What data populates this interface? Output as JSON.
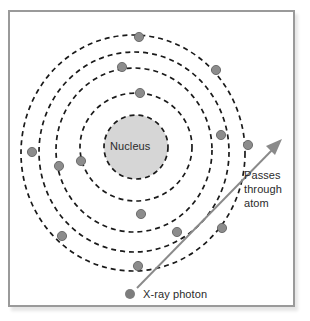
{
  "diagram": {
    "title_label": "Nucleus",
    "beam_label": "Passes\nthrough\natom",
    "photon_label": "X-ray photon",
    "colors": {
      "frame_border": "#9a9a9a",
      "background": "#ffffff",
      "nucleus_fill": "#d6d6d6",
      "orbit_stroke": "#1a1a1a",
      "electron_fill": "#8c8c8c",
      "electron_stroke": "#4a4a4a",
      "arrow_stroke": "#8a8a8a",
      "photon_fill": "#7d7d7d",
      "text": "#2b2b2b"
    },
    "nucleus": {
      "cx": 136,
      "cy": 147,
      "r": 32
    },
    "orbits": [
      {
        "name": "shell-1",
        "cx": 136,
        "cy": 147,
        "rx": 56,
        "ry": 54
      },
      {
        "name": "shell-2",
        "cx": 134,
        "cy": 150,
        "rx": 78,
        "ry": 82
      },
      {
        "name": "shell-3",
        "cx": 134,
        "cy": 152,
        "rx": 95,
        "ry": 100
      },
      {
        "name": "shell-4",
        "cx": 133,
        "cy": 153,
        "rx": 112,
        "ry": 118
      }
    ],
    "electrons": [
      {
        "cx": 139,
        "cy": 37
      },
      {
        "cx": 122,
        "cy": 67
      },
      {
        "cx": 140,
        "cy": 93
      },
      {
        "cx": 216,
        "cy": 70
      },
      {
        "cx": 81,
        "cy": 161
      },
      {
        "cx": 59,
        "cy": 166
      },
      {
        "cx": 32,
        "cy": 152
      },
      {
        "cx": 221,
        "cy": 135
      },
      {
        "cx": 248,
        "cy": 145
      },
      {
        "cx": 141,
        "cy": 214
      },
      {
        "cx": 177,
        "cy": 232
      },
      {
        "cx": 222,
        "cy": 228
      },
      {
        "cx": 62,
        "cy": 236
      },
      {
        "cx": 138,
        "cy": 266
      }
    ],
    "photon": {
      "cx": 130,
      "cy": 294,
      "r": 5
    },
    "beam_arrow": {
      "x1": 137,
      "y1": 288,
      "x2": 280,
      "y2": 142
    }
  }
}
